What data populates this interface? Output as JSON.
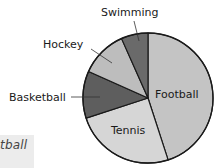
{
  "chart_data": {
    "type": "pie",
    "title": "",
    "units": "degrees",
    "start_angle_deg": 0,
    "direction": "clockwise",
    "categories": [
      "Football",
      "Tennis",
      "Basketball",
      "Hockey",
      "Swimming"
    ],
    "values": [
      162,
      90,
      42,
      42,
      24
    ],
    "percent_estimate": [
      45,
      25,
      11.7,
      11.7,
      6.7
    ],
    "colors": [
      "#c4c4c4",
      "#d6d6d6",
      "#5e5e5e",
      "#bdbdbd",
      "#6a6a6a"
    ],
    "label_positions": {
      "Football": "inside",
      "Tennis": "inside",
      "Basketball": "outside-left with leader line",
      "Hockey": "outside-top-left with leader line",
      "Swimming": "outside-top with leader line"
    }
  },
  "labels": {
    "football": "Football",
    "tennis": "Tennis",
    "basketball": "Basketball",
    "hockey": "Hockey",
    "swimming": "Swimming"
  },
  "fragment": {
    "text": "tball"
  }
}
